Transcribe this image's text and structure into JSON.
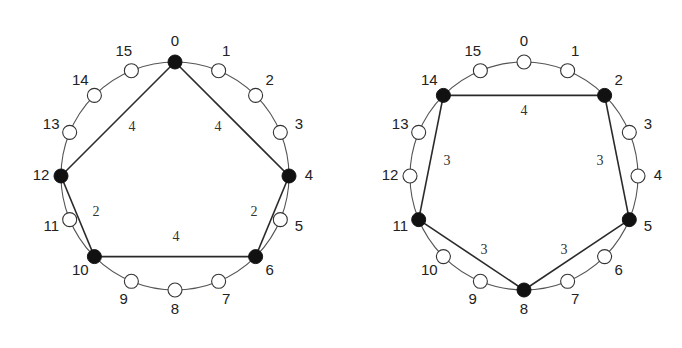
{
  "diagrams": [
    {
      "id": "left",
      "center": [
        175,
        176
      ],
      "radius": 114,
      "label_radius": 134,
      "node_count": 16,
      "node_labels": [
        "0",
        "1",
        "2",
        "3",
        "4",
        "5",
        "6",
        "7",
        "8",
        "9",
        "10",
        "11",
        "12",
        "13",
        "14",
        "15"
      ],
      "highlighted_nodes": [
        0,
        4,
        6,
        10,
        12
      ],
      "edges": [
        {
          "from": 0,
          "to": 4,
          "weight": "4",
          "label_pos": [
            218,
            128
          ]
        },
        {
          "from": 4,
          "to": 6,
          "weight": "2",
          "label_pos": [
            254,
            213
          ]
        },
        {
          "from": 6,
          "to": 10,
          "weight": "4",
          "label_pos": [
            176,
            238
          ]
        },
        {
          "from": 10,
          "to": 12,
          "weight": "2",
          "label_pos": [
            96,
            213
          ]
        },
        {
          "from": 12,
          "to": 0,
          "weight": "4",
          "label_pos": [
            132,
            128
          ]
        }
      ]
    },
    {
      "id": "right",
      "center": [
        524,
        176
      ],
      "radius": 114,
      "label_radius": 134,
      "node_count": 16,
      "node_labels": [
        "0",
        "1",
        "2",
        "3",
        "4",
        "5",
        "6",
        "7",
        "8",
        "9",
        "10",
        "11",
        "12",
        "13",
        "14",
        "15"
      ],
      "highlighted_nodes": [
        2,
        5,
        8,
        11,
        14
      ],
      "edges": [
        {
          "from": 14,
          "to": 2,
          "weight": "4",
          "label_pos": [
            524,
            112
          ]
        },
        {
          "from": 2,
          "to": 5,
          "weight": "3",
          "label_pos": [
            600,
            162
          ]
        },
        {
          "from": 5,
          "to": 8,
          "weight": "3",
          "label_pos": [
            564,
            251
          ]
        },
        {
          "from": 8,
          "to": 11,
          "weight": "3",
          "label_pos": [
            484,
            251
          ]
        },
        {
          "from": 11,
          "to": 14,
          "weight": "3",
          "label_pos": [
            447,
            162
          ]
        }
      ]
    }
  ],
  "style": {
    "node_radius": 7,
    "filled_color": "#111111",
    "open_color": "#ffffff",
    "edge_color": "#2a2a2a",
    "ring_color": "#555555"
  }
}
